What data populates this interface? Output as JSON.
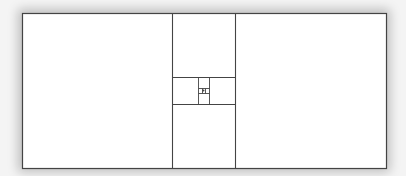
{
  "diagram": {
    "type": "nested-rectangle-subdivision",
    "stroke_color": "#444444",
    "fill_color": "#ffffff",
    "outer": {
      "x": 22,
      "y": 13,
      "w": 364,
      "h": 155
    },
    "lines": [
      {
        "x1": 172,
        "y1": 13,
        "x2": 172,
        "y2": 168
      },
      {
        "x1": 235,
        "y1": 13,
        "x2": 235,
        "y2": 168
      },
      {
        "x1": 172,
        "y1": 77,
        "x2": 235,
        "y2": 77
      },
      {
        "x1": 172,
        "y1": 104,
        "x2": 235,
        "y2": 104
      },
      {
        "x1": 198,
        "y1": 77,
        "x2": 198,
        "y2": 104
      },
      {
        "x1": 209,
        "y1": 77,
        "x2": 209,
        "y2": 104
      },
      {
        "x1": 198,
        "y1": 88,
        "x2": 209,
        "y2": 88
      },
      {
        "x1": 198,
        "y1": 93,
        "x2": 209,
        "y2": 93
      },
      {
        "x1": 202,
        "y1": 88,
        "x2": 202,
        "y2": 93
      },
      {
        "x1": 205,
        "y1": 88,
        "x2": 205,
        "y2": 93
      }
    ],
    "center_dot": {
      "x": 203.5,
      "y": 90.5,
      "r": 1
    }
  }
}
